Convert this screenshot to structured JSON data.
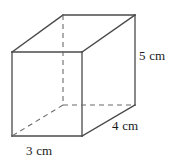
{
  "figure": {
    "kind": "rectangular-prism",
    "stroke_color": "#4a4a4a",
    "hidden_stroke_color": "#6b6b6b",
    "background_color": "#ffffff",
    "text_color": "#1a1a1a"
  },
  "labels": {
    "height": "5 cm",
    "depth": "4 cm",
    "width": "3 cm"
  },
  "geometry": {
    "front_face": {
      "top_left": [
        12,
        52
      ],
      "top_right": [
        82,
        52
      ],
      "bottom_right": [
        82,
        136
      ],
      "bottom_left": [
        12,
        136
      ]
    },
    "back_face": {
      "top_left": [
        63,
        15
      ],
      "top_right": [
        135,
        15
      ],
      "bottom_right": [
        135,
        105
      ],
      "bottom_left": [
        63,
        105
      ]
    },
    "visible_edges": [
      [
        [
          12,
          52
        ],
        [
          82,
          52
        ]
      ],
      [
        [
          82,
          52
        ],
        [
          82,
          136
        ]
      ],
      [
        [
          82,
          136
        ],
        [
          12,
          136
        ]
      ],
      [
        [
          12,
          136
        ],
        [
          12,
          52
        ]
      ],
      [
        [
          12,
          52
        ],
        [
          63,
          15
        ]
      ],
      [
        [
          63,
          15
        ],
        [
          135,
          15
        ]
      ],
      [
        [
          135,
          15
        ],
        [
          135,
          105
        ]
      ],
      [
        [
          82,
          52
        ],
        [
          135,
          15
        ]
      ],
      [
        [
          82,
          136
        ],
        [
          135,
          105
        ]
      ]
    ],
    "hidden_edges": [
      [
        [
          63,
          15
        ],
        [
          63,
          105
        ]
      ],
      [
        [
          63,
          105
        ],
        [
          135,
          105
        ]
      ],
      [
        [
          63,
          105
        ],
        [
          12,
          136
        ]
      ]
    ]
  }
}
